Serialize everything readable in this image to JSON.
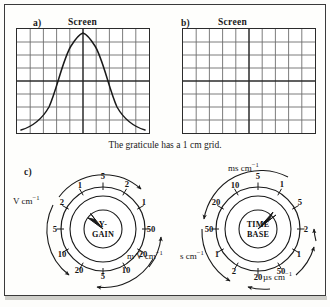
{
  "figure": {
    "panels": [
      {
        "key": "a",
        "label": "a)",
        "screen_title": "Screen"
      },
      {
        "key": "b",
        "label": "b)",
        "screen_title": "Screen"
      },
      {
        "key": "c",
        "label": "c)"
      }
    ],
    "caption": "The graticule has a 1 cm grid.",
    "graticule": {
      "columns": 10,
      "rows": 8,
      "grid_spacing_cm": 1,
      "center_axis_color": "#2b2b2b",
      "minor_grid_color": "#6e6e6e"
    },
    "waveform": {
      "shape": "bell-curve",
      "description": "single peak centred on vertical axis",
      "stroke_color": "#1a1a1a"
    },
    "dials": [
      {
        "key": "y-gain",
        "hub_line_1": "Y-",
        "hub_line_2": "GAIN",
        "scale_numbers": [
          "5",
          "2",
          "1",
          "50",
          "20",
          "10",
          "5",
          "20",
          "10",
          "5",
          "2",
          "1"
        ],
        "pointer_position_deg": -22,
        "outer_labels": [
          {
            "name": "volts-per-cm",
            "text": "V cm",
            "exponent": "−1"
          },
          {
            "name": "millivolts-per-cm",
            "text": "m V cm",
            "exponent": "−1"
          }
        ]
      },
      {
        "key": "time-base",
        "hub_line_1": "TIME",
        "hub_line_2": "BASE",
        "scale_numbers": [
          "5",
          "1",
          "5",
          "2",
          "1",
          "50",
          "20",
          "2",
          "1",
          "50",
          "20",
          "10"
        ],
        "pointer_position_deg": 38,
        "outer_labels": [
          {
            "name": "milliseconds-per-cm",
            "text": "ms cm",
            "exponent": "−1"
          },
          {
            "name": "seconds-per-cm",
            "text": "s cm",
            "exponent": "−1"
          },
          {
            "name": "microseconds-per-cm",
            "text": "µs cm",
            "exponent": "−1"
          }
        ]
      }
    ]
  }
}
